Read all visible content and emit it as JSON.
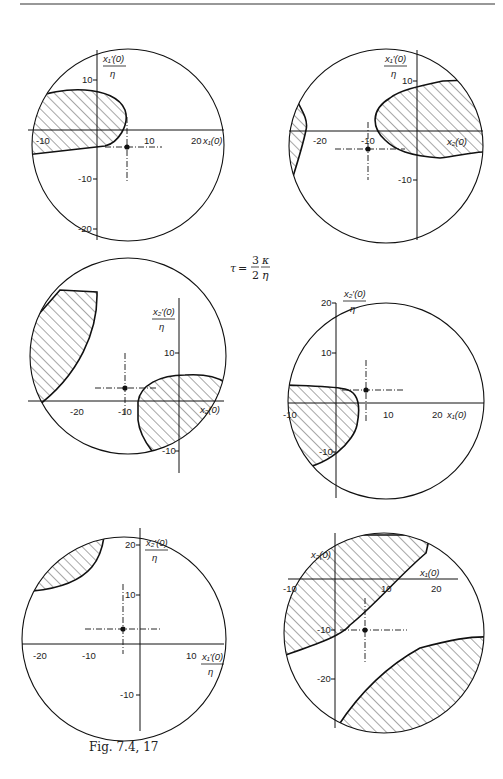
{
  "figure": {
    "caption": "Fig. 7.4, 17",
    "parameter_label": "τ = 3/2 · κ/η",
    "parameter": {
      "symbol": "τ",
      "eq": "=",
      "num": "3",
      "den": "2",
      "frac_num": "κ",
      "frac_den": "η"
    }
  },
  "panels": [
    {
      "id": "top-left",
      "x_axis": "x₁(0)",
      "y_axis_num": "x₁′(0)",
      "y_axis_den": "η",
      "x_ticks": [
        "-10",
        "10",
        "20"
      ],
      "y_ticks": [
        "10",
        "-10",
        "-20"
      ],
      "marker": {
        "x": 6,
        "y": -3
      }
    },
    {
      "id": "top-right",
      "x_axis": "x₂(0)",
      "y_axis_num": "x₁′(0)",
      "y_axis_den": "η",
      "x_ticks": [
        "-20",
        "-10"
      ],
      "y_ticks": [
        "10",
        "-10"
      ],
      "marker": {
        "x": -10,
        "y": -3
      }
    },
    {
      "id": "middle-left",
      "x_axis": "x₂(0)",
      "y_axis_num": "x₂′(0)",
      "y_axis_den": "η",
      "x_ticks": [
        "-20",
        "-10"
      ],
      "y_ticks": [
        "10",
        "-10"
      ],
      "marker": {
        "x": -10,
        "y": 3
      }
    },
    {
      "id": "middle-right",
      "x_axis": "x₁(0)",
      "y_axis_num": "x₂′(0)",
      "y_axis_den": "η",
      "x_ticks": [
        "-10",
        "10",
        "20"
      ],
      "y_ticks": [
        "20",
        "10",
        "-10"
      ],
      "marker": {
        "x": 6,
        "y": 3
      }
    },
    {
      "id": "bottom-left",
      "x_axis_num": "x₁′(0)",
      "x_axis_den": "η",
      "y_axis_num": "x₂′(0)",
      "y_axis_den": "η",
      "x_ticks": [
        "-20",
        "-10",
        "10"
      ],
      "y_ticks": [
        "20",
        "10",
        "-10"
      ],
      "marker": {
        "x": -3,
        "y": 3
      }
    },
    {
      "id": "bottom-right",
      "x_axis": "x₁(0)",
      "y_axis": "x₂(0)",
      "x_ticks": [
        "-10",
        "10",
        "20"
      ],
      "y_ticks": [
        "-10",
        "-20"
      ],
      "marker": {
        "x": 6,
        "y": -10
      }
    }
  ],
  "colors": {
    "ink": "#1a1a1a",
    "paper": "#ffffff"
  }
}
